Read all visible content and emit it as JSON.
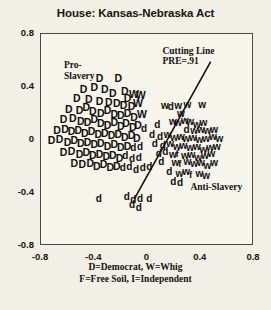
{
  "chart_data": {
    "type": "scatter",
    "title": "House:  Kansas-Nebraska Act",
    "xlabel": "",
    "ylabel": "",
    "xlim": [
      -0.8,
      0.8
    ],
    "ylim": [
      -0.8,
      0.8
    ],
    "xticks": [
      "-0.8",
      "-0.4",
      "0",
      "0.4",
      "0.8"
    ],
    "xtick_values": [
      -0.8,
      -0.4,
      0,
      0.4,
      0.8
    ],
    "yticks": [
      "0.8",
      "0.4",
      "0",
      "-0.4",
      "-0.8"
    ],
    "ytick_values": [
      0.8,
      0.4,
      0,
      -0.4,
      -0.8
    ],
    "grid": false,
    "legend_position": "below-axis",
    "caption_lines": [
      "D=Democrat, W=Whig",
      "F=Free Soil, I=Independent"
    ],
    "annotations": [
      {
        "name": "pro-slavery-label",
        "text": "Pro-\nSlavery",
        "x": -0.62,
        "y": 0.55
      },
      {
        "name": "anti-slavery-label",
        "text": "Anti-Slavery",
        "x": 0.33,
        "y": -0.37
      },
      {
        "name": "cutting-line-label",
        "text": "Cutting Line\nPRE=.91",
        "x": 0.12,
        "y": 0.66
      }
    ],
    "cutting_line": {
      "label": "Cutting Line",
      "pre": "PRE=.91",
      "x0": 0.48,
      "y0": 0.58,
      "x1": -0.09,
      "y1": -0.45
    },
    "marker_classes": [
      {
        "code": "D",
        "label": "Democrat",
        "vote": "yea"
      },
      {
        "code": "d",
        "label": "Democrat",
        "vote": "nay"
      },
      {
        "code": "W",
        "label": "Whig",
        "vote": "yea"
      },
      {
        "code": "w",
        "label": "Whig",
        "vote": "nay"
      },
      {
        "code": "F",
        "label": "Free Soil",
        "vote": "yea"
      },
      {
        "code": "f",
        "label": "Free Soil",
        "vote": "nay"
      },
      {
        "code": "I",
        "label": "Independent",
        "vote": "yea"
      },
      {
        "code": "i",
        "label": "Independent",
        "vote": "nay"
      }
    ],
    "points": [
      {
        "m": "D",
        "x": -0.355,
        "y": 0.455
      },
      {
        "m": "D",
        "x": -0.215,
        "y": 0.455
      },
      {
        "m": "D",
        "x": -0.475,
        "y": 0.375
      },
      {
        "m": "D",
        "x": -0.395,
        "y": 0.385
      },
      {
        "m": "D",
        "x": -0.315,
        "y": 0.375
      },
      {
        "m": "D",
        "x": -0.255,
        "y": 0.345
      },
      {
        "m": "D",
        "x": -0.165,
        "y": 0.355
      },
      {
        "m": "W",
        "x": -0.105,
        "y": 0.335
      },
      {
        "m": "W",
        "x": -0.055,
        "y": 0.325
      },
      {
        "m": "D",
        "x": -0.145,
        "y": 0.305
      },
      {
        "m": "D",
        "x": -0.525,
        "y": 0.305
      },
      {
        "m": "D",
        "x": -0.435,
        "y": 0.295
      },
      {
        "m": "D",
        "x": -0.355,
        "y": 0.285
      },
      {
        "m": "D",
        "x": -0.285,
        "y": 0.275
      },
      {
        "m": "D",
        "x": -0.225,
        "y": 0.265
      },
      {
        "m": "D",
        "x": -0.175,
        "y": 0.255
      },
      {
        "m": "D",
        "x": -0.115,
        "y": 0.245
      },
      {
        "m": "W",
        "x": -0.075,
        "y": 0.265
      },
      {
        "m": "D",
        "x": -0.585,
        "y": 0.225
      },
      {
        "m": "D",
        "x": -0.505,
        "y": 0.215
      },
      {
        "m": "D",
        "x": -0.455,
        "y": 0.235
      },
      {
        "m": "D",
        "x": -0.405,
        "y": 0.205
      },
      {
        "m": "D",
        "x": -0.345,
        "y": 0.195
      },
      {
        "m": "D",
        "x": -0.295,
        "y": 0.215
      },
      {
        "m": "D",
        "x": -0.245,
        "y": 0.185
      },
      {
        "m": "D",
        "x": -0.195,
        "y": 0.175
      },
      {
        "m": "D",
        "x": -0.145,
        "y": 0.195
      },
      {
        "m": "D",
        "x": -0.095,
        "y": 0.165
      },
      {
        "m": "W",
        "x": -0.045,
        "y": 0.185
      },
      {
        "m": "D",
        "x": -0.625,
        "y": 0.145
      },
      {
        "m": "D",
        "x": -0.555,
        "y": 0.155
      },
      {
        "m": "D",
        "x": -0.495,
        "y": 0.135
      },
      {
        "m": "D",
        "x": -0.445,
        "y": 0.125
      },
      {
        "m": "D",
        "x": -0.395,
        "y": 0.145
      },
      {
        "m": "D",
        "x": -0.345,
        "y": 0.115
      },
      {
        "m": "D",
        "x": -0.295,
        "y": 0.105
      },
      {
        "m": "D",
        "x": -0.245,
        "y": 0.125
      },
      {
        "m": "D",
        "x": -0.195,
        "y": 0.095
      },
      {
        "m": "D",
        "x": -0.155,
        "y": 0.115
      },
      {
        "m": "D",
        "x": -0.105,
        "y": 0.085
      },
      {
        "m": "D",
        "x": -0.065,
        "y": 0.105
      },
      {
        "m": "d",
        "x": -0.015,
        "y": 0.075
      },
      {
        "m": "D",
        "x": -0.675,
        "y": 0.065
      },
      {
        "m": "D",
        "x": -0.615,
        "y": 0.075
      },
      {
        "m": "D",
        "x": -0.565,
        "y": 0.055
      },
      {
        "m": "D",
        "x": -0.515,
        "y": 0.065
      },
      {
        "m": "D",
        "x": -0.465,
        "y": 0.045
      },
      {
        "m": "D",
        "x": -0.415,
        "y": 0.055
      },
      {
        "m": "D",
        "x": -0.365,
        "y": 0.035
      },
      {
        "m": "D",
        "x": -0.315,
        "y": 0.045
      },
      {
        "m": "D",
        "x": -0.265,
        "y": 0.025
      },
      {
        "m": "D",
        "x": -0.215,
        "y": 0.035
      },
      {
        "m": "D",
        "x": -0.165,
        "y": 0.015
      },
      {
        "m": "D",
        "x": -0.115,
        "y": 0.025
      },
      {
        "m": "D",
        "x": -0.075,
        "y": 0.005
      },
      {
        "m": "D",
        "x": -0.715,
        "y": -0.015
      },
      {
        "m": "D",
        "x": -0.655,
        "y": -0.005
      },
      {
        "m": "D",
        "x": -0.595,
        "y": -0.025
      },
      {
        "m": "D",
        "x": -0.545,
        "y": -0.015
      },
      {
        "m": "D",
        "x": -0.495,
        "y": -0.035
      },
      {
        "m": "D",
        "x": -0.445,
        "y": -0.025
      },
      {
        "m": "D",
        "x": -0.395,
        "y": -0.045
      },
      {
        "m": "D",
        "x": -0.345,
        "y": -0.035
      },
      {
        "m": "D",
        "x": -0.295,
        "y": -0.055
      },
      {
        "m": "D",
        "x": -0.245,
        "y": -0.045
      },
      {
        "m": "D",
        "x": -0.195,
        "y": -0.065
      },
      {
        "m": "D",
        "x": -0.145,
        "y": -0.055
      },
      {
        "m": "d",
        "x": -0.095,
        "y": -0.075
      },
      {
        "m": "d",
        "x": -0.045,
        "y": -0.065
      },
      {
        "m": "D",
        "x": -0.625,
        "y": -0.105
      },
      {
        "m": "D",
        "x": -0.565,
        "y": -0.095
      },
      {
        "m": "D",
        "x": -0.505,
        "y": -0.115
      },
      {
        "m": "D",
        "x": -0.455,
        "y": -0.105
      },
      {
        "m": "D",
        "x": -0.405,
        "y": -0.125
      },
      {
        "m": "D",
        "x": -0.355,
        "y": -0.115
      },
      {
        "m": "D",
        "x": -0.305,
        "y": -0.135
      },
      {
        "m": "D",
        "x": -0.255,
        "y": -0.125
      },
      {
        "m": "D",
        "x": -0.205,
        "y": -0.145
      },
      {
        "m": "d",
        "x": -0.155,
        "y": -0.135
      },
      {
        "m": "d",
        "x": -0.105,
        "y": -0.155
      },
      {
        "m": "d",
        "x": -0.055,
        "y": -0.145
      },
      {
        "m": "D",
        "x": -0.545,
        "y": -0.185
      },
      {
        "m": "D",
        "x": -0.485,
        "y": -0.195
      },
      {
        "m": "D",
        "x": -0.425,
        "y": -0.185
      },
      {
        "m": "D",
        "x": -0.375,
        "y": -0.205
      },
      {
        "m": "D",
        "x": -0.325,
        "y": -0.195
      },
      {
        "m": "D",
        "x": -0.275,
        "y": -0.215
      },
      {
        "m": "D",
        "x": -0.225,
        "y": -0.205
      },
      {
        "m": "d",
        "x": -0.175,
        "y": -0.225
      },
      {
        "m": "d",
        "x": -0.125,
        "y": -0.215
      },
      {
        "m": "d",
        "x": -0.075,
        "y": -0.235
      },
      {
        "m": "d",
        "x": -0.025,
        "y": -0.225
      },
      {
        "m": "d",
        "x": 0.025,
        "y": -0.215
      },
      {
        "m": "d",
        "x": -0.355,
        "y": -0.455
      },
      {
        "m": "d",
        "x": -0.145,
        "y": -0.445
      },
      {
        "m": "d",
        "x": -0.095,
        "y": -0.465
      },
      {
        "m": "d",
        "x": -0.105,
        "y": -0.505
      },
      {
        "m": "d",
        "x": -0.045,
        "y": -0.455
      },
      {
        "m": "d",
        "x": -0.055,
        "y": -0.525
      },
      {
        "m": "d",
        "x": 0.025,
        "y": -0.455
      },
      {
        "m": "w",
        "x": 0.135,
        "y": 0.245
      },
      {
        "m": "w",
        "x": 0.235,
        "y": 0.245
      },
      {
        "m": "w",
        "x": 0.305,
        "y": 0.255
      },
      {
        "m": "w",
        "x": 0.415,
        "y": 0.255
      },
      {
        "m": "d",
        "x": 0.185,
        "y": 0.235
      },
      {
        "m": "w",
        "x": 0.255,
        "y": 0.185
      },
      {
        "m": "d",
        "x": 0.085,
        "y": 0.105
      },
      {
        "m": "w",
        "x": 0.195,
        "y": 0.125
      },
      {
        "m": "w",
        "x": 0.235,
        "y": 0.115
      },
      {
        "m": "w",
        "x": 0.285,
        "y": 0.135
      },
      {
        "m": "w",
        "x": 0.325,
        "y": 0.125
      },
      {
        "m": "w",
        "x": 0.375,
        "y": 0.105
      },
      {
        "m": "w",
        "x": 0.425,
        "y": 0.115
      },
      {
        "m": "d",
        "x": 0.305,
        "y": 0.065
      },
      {
        "m": "w",
        "x": 0.355,
        "y": 0.055
      },
      {
        "m": "w",
        "x": 0.405,
        "y": 0.065
      },
      {
        "m": "w",
        "x": 0.455,
        "y": 0.055
      },
      {
        "m": "w",
        "x": 0.505,
        "y": 0.065
      },
      {
        "m": "d",
        "x": 0.045,
        "y": 0.025
      },
      {
        "m": "d",
        "x": 0.105,
        "y": 0.015
      },
      {
        "m": "w",
        "x": 0.155,
        "y": 0.025
      },
      {
        "m": "w",
        "x": 0.205,
        "y": 0.005
      },
      {
        "m": "w",
        "x": 0.255,
        "y": 0.015
      },
      {
        "m": "w",
        "x": 0.295,
        "y": -0.005
      },
      {
        "m": "w",
        "x": 0.345,
        "y": 0.005
      },
      {
        "m": "w",
        "x": 0.395,
        "y": -0.015
      },
      {
        "m": "w",
        "x": 0.445,
        "y": -0.005
      },
      {
        "m": "w",
        "x": 0.495,
        "y": 0.015
      },
      {
        "m": "w",
        "x": 0.545,
        "y": -0.005
      },
      {
        "m": "d",
        "x": 0.065,
        "y": -0.045
      },
      {
        "m": "d",
        "x": 0.125,
        "y": -0.055
      },
      {
        "m": "w",
        "x": 0.175,
        "y": -0.045
      },
      {
        "m": "w",
        "x": 0.225,
        "y": -0.065
      },
      {
        "m": "w",
        "x": 0.275,
        "y": -0.055
      },
      {
        "m": "w",
        "x": 0.325,
        "y": -0.075
      },
      {
        "m": "w",
        "x": 0.375,
        "y": -0.065
      },
      {
        "m": "w",
        "x": 0.425,
        "y": -0.085
      },
      {
        "m": "w",
        "x": 0.475,
        "y": -0.075
      },
      {
        "m": "w",
        "x": 0.525,
        "y": -0.065
      },
      {
        "m": "d",
        "x": 0.095,
        "y": -0.115
      },
      {
        "m": "d",
        "x": 0.145,
        "y": -0.105
      },
      {
        "m": "w",
        "x": 0.195,
        "y": -0.125
      },
      {
        "m": "f",
        "x": 0.245,
        "y": -0.115
      },
      {
        "m": "w",
        "x": 0.285,
        "y": -0.135
      },
      {
        "m": "w",
        "x": 0.335,
        "y": -0.125
      },
      {
        "m": "w",
        "x": 0.385,
        "y": -0.145
      },
      {
        "m": "w",
        "x": 0.435,
        "y": -0.135
      },
      {
        "m": "w",
        "x": 0.485,
        "y": -0.115
      },
      {
        "m": "d",
        "x": 0.115,
        "y": -0.175
      },
      {
        "m": "w",
        "x": 0.215,
        "y": -0.185
      },
      {
        "m": "f",
        "x": 0.265,
        "y": -0.195
      },
      {
        "m": "w",
        "x": 0.305,
        "y": -0.175
      },
      {
        "m": "w",
        "x": 0.355,
        "y": -0.195
      },
      {
        "m": "w",
        "x": 0.405,
        "y": -0.185
      },
      {
        "m": "w",
        "x": 0.455,
        "y": -0.205
      },
      {
        "m": "w",
        "x": 0.505,
        "y": -0.185
      },
      {
        "m": "d",
        "x": 0.175,
        "y": -0.255
      },
      {
        "m": "w",
        "x": 0.245,
        "y": -0.265
      },
      {
        "m": "w",
        "x": 0.295,
        "y": -0.255
      },
      {
        "m": "f",
        "x": 0.345,
        "y": -0.275
      },
      {
        "m": "w",
        "x": 0.395,
        "y": -0.265
      },
      {
        "m": "w",
        "x": 0.445,
        "y": -0.285
      },
      {
        "m": "d",
        "x": 0.205,
        "y": -0.325
      },
      {
        "m": "d",
        "x": 0.255,
        "y": -0.335
      }
    ]
  }
}
